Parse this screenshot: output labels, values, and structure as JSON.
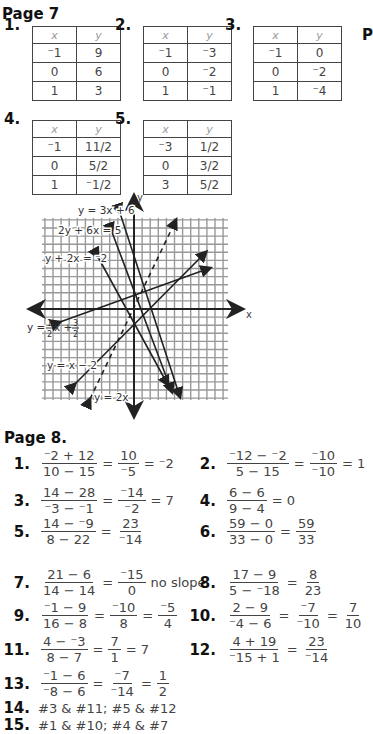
{
  "page7": {
    "title": "Page 7",
    "side_letter": "P",
    "tables": [
      {
        "label": "1.",
        "headers": [
          "x",
          "y"
        ],
        "rows": [
          [
            "-1",
            "9"
          ],
          [
            "0",
            "6"
          ],
          [
            "1",
            "3"
          ]
        ]
      },
      {
        "label": "2.",
        "headers": [
          "x",
          "y"
        ],
        "rows": [
          [
            "-1",
            "-3"
          ],
          [
            "0",
            "-2"
          ],
          [
            "1",
            "-1"
          ]
        ]
      },
      {
        "label": "3.",
        "headers": [
          "x",
          "y"
        ],
        "rows": [
          [
            "-1",
            "0"
          ],
          [
            "0",
            "-2"
          ],
          [
            "1",
            "-4"
          ]
        ]
      },
      {
        "label": "4.",
        "headers": [
          "x",
          "y"
        ],
        "rows": [
          [
            "-1",
            "11/2"
          ],
          [
            "0",
            "5/2"
          ],
          [
            "1",
            "-1/2"
          ]
        ]
      },
      {
        "label": "5.",
        "headers": [
          "x",
          "y"
        ],
        "rows": [
          [
            "-3",
            "1/2"
          ],
          [
            "0",
            "3/2"
          ],
          [
            "3",
            "5/2"
          ]
        ]
      }
    ],
    "graph": {
      "x_label": "x",
      "y_label": "y",
      "line_labels": {
        "l1": "y = 3x + 6",
        "l2": "2y + 6x = 5",
        "l3": "y + 2x = -2",
        "l4_a": "y =",
        "l4_b": "x +",
        "l5": "y = x - 2",
        "l6": "y = 2x"
      }
    }
  },
  "chart_data": {
    "type": "line",
    "title": "",
    "xlabel": "x",
    "ylabel": "y",
    "grid": true,
    "xlim": [
      -11,
      11
    ],
    "ylim": [
      -11,
      11
    ],
    "series": [
      {
        "name": "y = 3x + 6",
        "slope": -3,
        "intercept": 3,
        "style": "solid"
      },
      {
        "name": "2y + 6x = 5",
        "slope": -3,
        "intercept": 2.5,
        "style": "solid"
      },
      {
        "name": "y + 2x = -2",
        "slope": -2,
        "intercept": -2,
        "style": "solid"
      },
      {
        "name": "y = 1/2x + 3/2",
        "slope": 0.333,
        "intercept": 1.5,
        "style": "solid"
      },
      {
        "name": "y = x - 2",
        "slope": 1,
        "intercept": -2,
        "style": "solid"
      },
      {
        "name": "y = 2x",
        "slope": 3,
        "intercept": 0,
        "style": "dashed"
      }
    ]
  },
  "page8": {
    "title": "Page 8.",
    "problems": [
      {
        "n": "1.",
        "parts": [
          [
            "-2 + 12",
            "10 - 15"
          ],
          "=",
          [
            "10",
            "-5"
          ],
          "= -2"
        ]
      },
      {
        "n": "2.",
        "parts": [
          [
            "-12 - -2",
            "5 - 15"
          ],
          "=",
          [
            "-10",
            "-10"
          ],
          "= 1"
        ]
      },
      {
        "n": "3.",
        "parts": [
          [
            "14 - 28",
            "-3 - -1"
          ],
          "=",
          [
            "-14",
            "-2"
          ],
          "= 7"
        ]
      },
      {
        "n": "4.",
        "parts": [
          [
            "6 - 6",
            "9 - 4"
          ],
          "= 0"
        ]
      },
      {
        "n": "5.",
        "parts": [
          [
            "14 - -9",
            "8 - 22"
          ],
          "=",
          [
            "23",
            "-14"
          ]
        ]
      },
      {
        "n": "6.",
        "parts": [
          [
            "59 - 0",
            "33 - 0"
          ],
          "=",
          [
            "59",
            "33"
          ]
        ]
      },
      {
        "n": "7.",
        "parts": [
          [
            "21 - 6",
            "14 - 14"
          ],
          "=",
          [
            "-15",
            "0"
          ],
          "no slope"
        ]
      },
      {
        "n": "8.",
        "parts": [
          [
            "17 - 9",
            "5 - -18"
          ],
          "=",
          [
            "8",
            "23"
          ]
        ]
      },
      {
        "n": "9.",
        "parts": [
          [
            "-1 - 9",
            "16 - 8"
          ],
          "=",
          [
            "-10",
            "8"
          ],
          "=",
          [
            "-5",
            "4"
          ]
        ]
      },
      {
        "n": "10.",
        "parts": [
          [
            "2 - 9",
            "-4 - 6"
          ],
          "=",
          [
            "-7",
            "-10"
          ],
          "=",
          [
            "7",
            "10"
          ]
        ]
      },
      {
        "n": "11.",
        "parts": [
          [
            "4 - -3",
            "8 - 7"
          ],
          "=",
          [
            "7",
            "1"
          ],
          "= 7"
        ]
      },
      {
        "n": "12.",
        "parts": [
          [
            "4 + 19",
            "-15 + 1"
          ],
          "=",
          [
            "23",
            "-14"
          ]
        ]
      },
      {
        "n": "13.",
        "parts": [
          [
            "-1 - 6",
            "-8 - 6"
          ],
          "=",
          [
            "-7",
            "-14"
          ],
          "=",
          [
            "1",
            "2"
          ]
        ]
      }
    ],
    "line14": {
      "n": "14.",
      "text": "#3 & #11; #5 & #12"
    },
    "line15": {
      "n": "15.",
      "text": "#1 & #10; #4 & #7"
    }
  }
}
